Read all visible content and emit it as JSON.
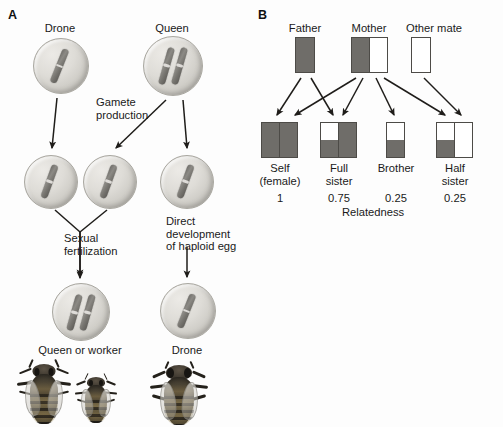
{
  "figure": {
    "panels": [
      {
        "letter": "A"
      },
      {
        "letter": "B"
      }
    ]
  },
  "panel_a": {
    "letter": "A",
    "cells": [
      {
        "id": "drone-parent",
        "label": "Drone",
        "ploidy": "haploid",
        "chromosomes": 1
      },
      {
        "id": "queen-parent",
        "label": "Queen",
        "ploidy": "diploid",
        "chromosomes": 2
      },
      {
        "id": "sperm-gamete",
        "label": "",
        "ploidy": "haploid",
        "chromosomes": 1
      },
      {
        "id": "egg-gamete-1",
        "label": "",
        "ploidy": "haploid",
        "chromosomes": 1
      },
      {
        "id": "egg-gamete-2",
        "label": "",
        "ploidy": "haploid",
        "chromosomes": 1
      },
      {
        "id": "zygote-female",
        "label": "Queen or worker",
        "ploidy": "diploid",
        "chromosomes": 2
      },
      {
        "id": "haploid-egg",
        "label": "Drone",
        "ploidy": "haploid",
        "chromosomes": 1
      }
    ],
    "process_labels": [
      {
        "id": "gamete-production",
        "line1": "Gamete",
        "line2": "production"
      },
      {
        "id": "sexual-fertilization",
        "line1": "Sexual",
        "line2": "fertilization"
      },
      {
        "id": "direct-development",
        "line1": "Direct",
        "line2": "development",
        "line3": "of haploid egg"
      }
    ],
    "outcome_labels": [
      {
        "id": "queen-or-worker",
        "text": "Queen or worker"
      },
      {
        "id": "drone",
        "text": "Drone"
      }
    ],
    "bees": [
      {
        "id": "queen-bee",
        "caste": "queen"
      },
      {
        "id": "worker-bee",
        "caste": "worker"
      },
      {
        "id": "drone-bee",
        "caste": "drone"
      }
    ]
  },
  "panel_b": {
    "letter": "B",
    "parents": [
      {
        "id": "father",
        "label": "Father",
        "columns": [
          [
            "dark"
          ]
        ]
      },
      {
        "id": "mother",
        "label": "Mother",
        "columns": [
          [
            "dark"
          ],
          [
            "white"
          ]
        ]
      },
      {
        "id": "other-mate",
        "label": "Other mate",
        "columns": [
          [
            "white"
          ]
        ]
      }
    ],
    "offspring": [
      {
        "id": "self",
        "label_line1": "Self",
        "label_line2": "(female)",
        "relatedness": "1",
        "columns": [
          [
            "dark",
            "dark"
          ],
          [
            "dark",
            "dark"
          ]
        ]
      },
      {
        "id": "full-sister",
        "label_line1": "Full",
        "label_line2": "sister",
        "relatedness": "0.75",
        "columns": [
          [
            "white",
            "dark"
          ],
          [
            "dark",
            "dark"
          ]
        ]
      },
      {
        "id": "brother",
        "label_line1": "Brother",
        "label_line2": "",
        "relatedness": "0.25",
        "columns": [
          [
            "white",
            "dark"
          ]
        ]
      },
      {
        "id": "half-sister",
        "label_line1": "Half",
        "label_line2": "sister",
        "relatedness": "0.25",
        "columns": [
          [
            "white",
            "dark"
          ],
          [
            "white",
            "white"
          ]
        ]
      }
    ],
    "axis_label": "Relatedness"
  },
  "colors": {
    "chromosome_dark": "#6f6d69",
    "box_stroke": "#4d4b47",
    "arrow": "#1f1d1a",
    "cell_fill": "#dedcd7",
    "text": "#1a1a1a"
  }
}
